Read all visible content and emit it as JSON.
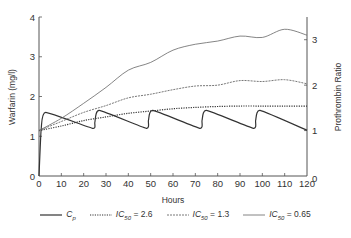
{
  "chart_data": {
    "type": "line",
    "title": "",
    "xlabel": "Hours",
    "ylabel": "Warfarin (mg/l)",
    "y2label": "Prothrombin Ratio",
    "xlim": [
      0,
      120
    ],
    "ylim": [
      0,
      4
    ],
    "y2lim": [
      0,
      3.5
    ],
    "x_ticks": [
      0,
      10,
      20,
      30,
      40,
      50,
      60,
      70,
      80,
      90,
      100,
      110,
      120
    ],
    "y_ticks": [
      0,
      1,
      2,
      3,
      4
    ],
    "y2_ticks": [
      0,
      1,
      2,
      3
    ],
    "grid": false,
    "legend_position": "bottom",
    "series": [
      {
        "name": "Cp",
        "axis": "left",
        "style": "solid-thick",
        "x": [
          0,
          1,
          3,
          24,
          25,
          27,
          48,
          49,
          51,
          72,
          73,
          75,
          96,
          97,
          99,
          120
        ],
        "values": [
          0,
          1.2,
          1.6,
          1.2,
          1.35,
          1.65,
          1.2,
          1.4,
          1.65,
          1.2,
          1.4,
          1.65,
          1.2,
          1.4,
          1.65,
          1.15
        ]
      },
      {
        "name": "IC50 = 2.6",
        "axis": "right",
        "style": "dotted",
        "x": [
          0,
          10,
          20,
          30,
          40,
          50,
          60,
          70,
          80,
          90,
          100,
          110,
          120
        ],
        "values": [
          1.0,
          1.1,
          1.22,
          1.3,
          1.38,
          1.43,
          1.48,
          1.51,
          1.53,
          1.54,
          1.54,
          1.54,
          1.54
        ]
      },
      {
        "name": "IC50 = 1.3",
        "axis": "right",
        "style": "dashed",
        "x": [
          0,
          10,
          20,
          30,
          40,
          50,
          60,
          70,
          80,
          90,
          100,
          110,
          120
        ],
        "values": [
          1.0,
          1.2,
          1.4,
          1.55,
          1.72,
          1.8,
          1.9,
          1.98,
          2.0,
          2.1,
          2.08,
          2.12,
          2.03
        ]
      },
      {
        "name": "IC50 = 0.65",
        "axis": "right",
        "style": "solid-thin",
        "x": [
          0,
          10,
          20,
          30,
          40,
          50,
          60,
          70,
          80,
          90,
          100,
          110,
          120
        ],
        "values": [
          1.0,
          1.27,
          1.6,
          1.95,
          2.33,
          2.5,
          2.77,
          2.9,
          2.97,
          3.08,
          3.05,
          3.23,
          3.1
        ]
      }
    ]
  },
  "legend": {
    "items": [
      {
        "symbol": "C",
        "sub": "p",
        "suffix": ""
      },
      {
        "symbol": "IC",
        "sub": "50",
        "suffix": " = 2.6"
      },
      {
        "symbol": "IC",
        "sub": "50",
        "suffix": " = 1.3"
      },
      {
        "symbol": "IC",
        "sub": "50",
        "suffix": " = 0.65"
      }
    ]
  },
  "colors": {
    "line": "#333333",
    "axis": "#555555",
    "background": "#ffffff"
  }
}
